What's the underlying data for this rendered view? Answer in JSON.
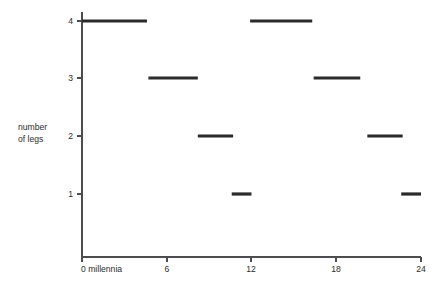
{
  "chart_data": {
    "type": "line",
    "style": "step",
    "title": "",
    "xlabel": "",
    "ylabel": "number of legs",
    "ylabel_lines": [
      "number",
      "of legs"
    ],
    "x_tick_labels": [
      "0 millennia",
      "6",
      "12",
      "18",
      "24"
    ],
    "x_tick_values": [
      0,
      6,
      12,
      18,
      24
    ],
    "y_tick_labels": [
      "1",
      "2",
      "3",
      "4"
    ],
    "y_tick_values": [
      1,
      2,
      3,
      4
    ],
    "xlim": [
      0,
      24
    ],
    "ylim": [
      0,
      4.3
    ],
    "grid": false,
    "legend": null,
    "line_color": "#2b2b2b",
    "axis_color": "#4d4d4f",
    "background": "#ffffff",
    "segments": [
      {
        "x_start": 0.0,
        "x_end": 4.6,
        "value": 4
      },
      {
        "x_start": 4.7,
        "x_end": 8.2,
        "value": 3
      },
      {
        "x_start": 8.2,
        "x_end": 10.7,
        "value": 2
      },
      {
        "x_start": 10.6,
        "x_end": 12.0,
        "value": 1
      },
      {
        "x_start": 11.9,
        "x_end": 16.3,
        "value": 4
      },
      {
        "x_start": 16.4,
        "x_end": 19.7,
        "value": 3
      },
      {
        "x_start": 20.2,
        "x_end": 22.7,
        "value": 2
      },
      {
        "x_start": 22.6,
        "x_end": 24.0,
        "value": 1
      }
    ]
  },
  "geometry": {
    "plot_left": 82,
    "plot_right": 421,
    "axis_bottom_y": 257,
    "axis_top_y": 12,
    "y_pix": {
      "1": 194,
      "2": 136,
      "3": 78,
      "4": 21
    },
    "x_tick_pix": [
      82,
      167,
      251,
      336,
      421
    ],
    "ylabel_x": 18,
    "ylabel_y1": 130,
    "ylabel_y2": 142,
    "xtick_label_y": 272,
    "tick_len": 5
  }
}
